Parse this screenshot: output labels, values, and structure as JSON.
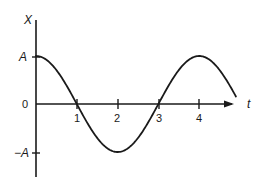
{
  "diagram": {
    "y_axis_label": "X",
    "x_axis_label": "t",
    "origin_label": "0",
    "amplitude_pos_label": "A",
    "amplitude_neg_label": "−A",
    "ticks": [
      {
        "value": 1,
        "label": "1"
      },
      {
        "value": 2,
        "label": "2"
      },
      {
        "value": 3,
        "label": "3"
      },
      {
        "value": 4,
        "label": "4"
      }
    ],
    "curve": {
      "function": "X = A cos(π t / 2)",
      "t_start": 0,
      "t_end": 4.9,
      "period": 4
    },
    "colors": {
      "line": "#1a1a1a",
      "background": "#ffffff"
    }
  }
}
